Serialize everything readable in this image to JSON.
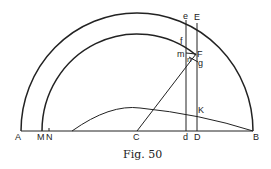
{
  "figure": {
    "caption": "Fig. 50",
    "points": {
      "A": "A",
      "M": "M",
      "N": "N",
      "C": "C",
      "d": "d",
      "D": "D",
      "B": "B",
      "e": "e",
      "E": "E",
      "f": "f",
      "F": "F",
      "m": "m",
      "n": "n",
      "g": "g",
      "K": "K"
    }
  }
}
